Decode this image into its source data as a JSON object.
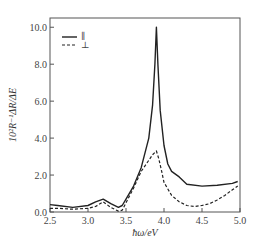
{
  "chart_data": {
    "type": "line",
    "title": "",
    "xlabel": "ħω/eV",
    "ylabel": "10²R⁻¹ΔR/ΔE",
    "xlim": [
      2.5,
      5.0
    ],
    "ylim": [
      0.0,
      10.5
    ],
    "x_ticks": [
      "2.5",
      "3.0",
      "3.5",
      "4.0",
      "4.5",
      "5.0"
    ],
    "y_ticks": [
      "0.0",
      "2.0",
      "4.0",
      "6.0",
      "8.0",
      "10.0"
    ],
    "grid": false,
    "legend_position": "upper-left",
    "series": [
      {
        "name": "∥",
        "style": "solid",
        "x": [
          2.5,
          2.6,
          2.8,
          3.0,
          3.1,
          3.2,
          3.3,
          3.4,
          3.45,
          3.5,
          3.6,
          3.7,
          3.8,
          3.85,
          3.88,
          3.9,
          3.92,
          3.95,
          4.0,
          4.05,
          4.1,
          4.2,
          4.3,
          4.5,
          4.7,
          4.9,
          4.97
        ],
        "y": [
          0.4,
          0.35,
          0.25,
          0.35,
          0.55,
          0.7,
          0.45,
          0.25,
          0.35,
          0.7,
          1.4,
          2.4,
          4.0,
          5.8,
          8.0,
          10.0,
          8.0,
          5.5,
          3.6,
          2.6,
          2.2,
          1.9,
          1.5,
          1.4,
          1.45,
          1.55,
          1.65
        ]
      },
      {
        "name": "⊥",
        "style": "dashed",
        "x": [
          2.5,
          2.6,
          2.8,
          3.0,
          3.1,
          3.2,
          3.3,
          3.4,
          3.45,
          3.5,
          3.6,
          3.7,
          3.8,
          3.85,
          3.9,
          3.93,
          3.97,
          4.0,
          4.1,
          4.2,
          4.3,
          4.4,
          4.5,
          4.6,
          4.7,
          4.8,
          4.9,
          4.97
        ],
        "y": [
          0.2,
          0.2,
          0.15,
          0.2,
          0.3,
          0.55,
          0.25,
          0.05,
          0.1,
          0.5,
          1.3,
          2.2,
          2.8,
          3.1,
          3.3,
          2.9,
          2.2,
          1.6,
          0.9,
          0.55,
          0.35,
          0.3,
          0.35,
          0.45,
          0.65,
          0.9,
          1.2,
          1.4
        ]
      }
    ]
  },
  "legend": {
    "parallel_label": "∥",
    "perpendicular_label": "⊥"
  }
}
